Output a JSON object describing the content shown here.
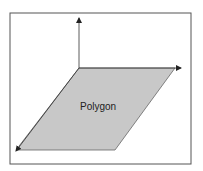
{
  "diagram": {
    "polygon_label": "Polygon",
    "colors": {
      "frame": "#555555",
      "polygon_fill": "#c8c8c8",
      "polygon_stroke": "#555555",
      "axis": "#333333",
      "background": "#ffffff"
    }
  }
}
